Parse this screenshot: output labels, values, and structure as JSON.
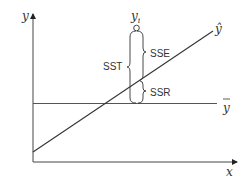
{
  "diagram": {
    "title": "",
    "axes": {
      "x_label": "x",
      "y_label": "y"
    },
    "lines": {
      "regression": "ŷ",
      "mean": "y"
    },
    "point": {
      "label": "y",
      "subscript": "i"
    },
    "braces": {
      "total": "SST",
      "error": "SSE",
      "regression": "SSR"
    },
    "colors": {
      "line": "#333333",
      "mean_line": "#555555"
    }
  }
}
